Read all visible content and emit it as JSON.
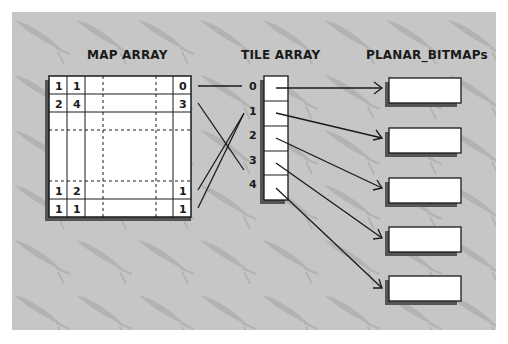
{
  "titles": {
    "map_array": "MAP ARRAY",
    "tile_array": "TILE ARRAY",
    "planar_bitmaps": "PLANAR_BITMAPs"
  },
  "map_array": {
    "rows": [
      [
        "1",
        "1",
        "",
        "",
        "",
        "0"
      ],
      [
        "2",
        "4",
        "",
        "",
        "",
        "3"
      ],
      [
        "",
        "",
        "",
        "",
        "",
        ""
      ],
      [
        "",
        "",
        "",
        "",
        "",
        ""
      ],
      [
        "1",
        "2",
        "",
        "",
        "",
        "1"
      ],
      [
        "1",
        "1",
        "",
        "",
        "",
        "1"
      ]
    ]
  },
  "tile_array": {
    "indices": [
      "0",
      "1",
      "2",
      "3",
      "4"
    ]
  },
  "planar_bitmaps": {
    "count": 5
  },
  "colors": {
    "background": "#c6c6c6",
    "line": "#1a1a1a",
    "box_fill": "#ffffff",
    "shadow": "#555555",
    "watermark": "#b0b0b0"
  },
  "connections": {
    "map_to_tile": [
      {
        "from": "map row 0 last col (0)",
        "to": "tile 0"
      },
      {
        "from": "map row 1 last col (3)",
        "to": "tile 3"
      },
      {
        "from": "map row 4 last col (1)",
        "to": "tile 1"
      },
      {
        "from": "map row 5 last col (1)",
        "to": "tile 1"
      }
    ],
    "tile_to_bitmap": [
      {
        "from": "tile 0",
        "to": "bitmap 0"
      },
      {
        "from": "tile 1",
        "to": "bitmap 1"
      },
      {
        "from": "tile 2",
        "to": "bitmap 2"
      },
      {
        "from": "tile 3",
        "to": "bitmap 3"
      },
      {
        "from": "tile 4",
        "to": "bitmap 4"
      }
    ]
  }
}
